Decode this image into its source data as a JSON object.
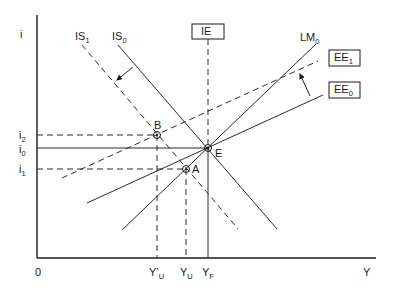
{
  "diagram": {
    "type": "IS-LM-EE macroeconomic diagram",
    "axes": {
      "y_label": "i",
      "x_label": "Y",
      "origin_label": "0"
    },
    "interest_levels": [
      {
        "id": "i2",
        "base": "i",
        "sub": "2"
      },
      {
        "id": "i0",
        "base": "i",
        "sub": "0"
      },
      {
        "id": "i1",
        "base": "i",
        "sub": "1"
      }
    ],
    "income_levels": [
      {
        "id": "Y_prime_U",
        "base": "Y’",
        "sub": "U"
      },
      {
        "id": "Y_U",
        "base": "Y",
        "sub": "U"
      },
      {
        "id": "Y_F",
        "base": "Y",
        "sub": "F"
      }
    ],
    "curves": {
      "IS1": {
        "base": "IS",
        "sub": "1",
        "style": "dashed"
      },
      "IS0": {
        "base": "IS",
        "sub": "0",
        "style": "solid"
      },
      "LM0": {
        "base": "LM",
        "sub": "0",
        "style": "solid"
      },
      "EE1": {
        "base": "EE",
        "sub": "1",
        "style": "dashed",
        "boxed": true
      },
      "EE0": {
        "base": "EE",
        "sub": "0",
        "style": "solid",
        "boxed": true
      },
      "IE": {
        "label": "IE",
        "style": "dashed vertical",
        "boxed": true
      }
    },
    "points": {
      "B": "B",
      "E": "E",
      "A": "A"
    },
    "shifts": [
      {
        "from": "IS0",
        "to": "IS1",
        "direction": "left"
      },
      {
        "from": "EE0",
        "to": "EE1",
        "direction": "up"
      }
    ]
  }
}
